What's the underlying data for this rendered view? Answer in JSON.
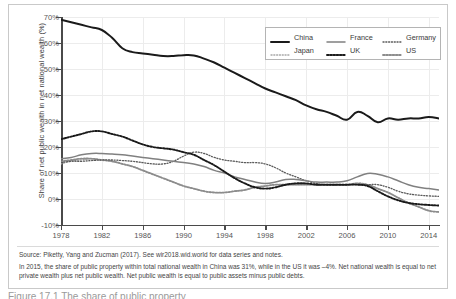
{
  "figure": {
    "ylabel": "Share of net public wealth in net national wealth (%)",
    "yticks": [
      "70%",
      "60%",
      "50%",
      "40%",
      "30%",
      "20%",
      "10%",
      "0%",
      "-10%"
    ],
    "xticks": [
      "1978",
      "1982",
      "1986",
      "1990",
      "1994",
      "1998",
      "2002",
      "2006",
      "2010",
      "2014"
    ],
    "legend": [
      {
        "label": "China",
        "style": "thick-solid-black"
      },
      {
        "label": "France",
        "style": "medium-solid-gray"
      },
      {
        "label": "Germany",
        "style": "fine-dotted-gray"
      },
      {
        "label": "Japan",
        "style": "fine-dotted-light"
      },
      {
        "label": "UK",
        "style": "bold-dotted-black"
      },
      {
        "label": "US",
        "style": "bold-dotted-gray"
      }
    ],
    "notes": {
      "source": "Source: Piketty, Yang and Zucman (2017). See wir2018.wid.world for data series and notes.",
      "detail": "In 2015, the share of public property within total national wealth in China was 31%, while in the US it was –4%. Net national wealth is equal to net private wealth plus net public wealth. Net public wealth is equal to public assets minus public debts."
    },
    "caption": "Figure 17.1 The share of public property"
  },
  "colors": {
    "china": "#1a1a1a",
    "france": "#808080",
    "germany": "#5a5a5a",
    "japan": "#a8a8a8",
    "uk": "#1a1a1a",
    "us": "#8c8c8c",
    "grid": "#ececec",
    "axis": "#4a4a4a"
  },
  "chart_data": {
    "type": "line",
    "title": "",
    "xlabel": "",
    "ylabel": "Share of net public wealth in net national wealth (%)",
    "xlim": [
      1978,
      2015
    ],
    "ylim": [
      -10,
      70
    ],
    "ytick_step": 10,
    "grid": true,
    "legend_position": "top-right",
    "x": [
      1978,
      1979,
      1980,
      1981,
      1982,
      1983,
      1984,
      1985,
      1986,
      1987,
      1988,
      1989,
      1990,
      1991,
      1992,
      1993,
      1994,
      1995,
      1996,
      1997,
      1998,
      1999,
      2000,
      2001,
      2002,
      2003,
      2004,
      2005,
      2006,
      2007,
      2008,
      2009,
      2010,
      2011,
      2012,
      2013,
      2014,
      2015
    ],
    "series": [
      {
        "name": "China",
        "values": [
          69,
          68,
          67,
          66,
          65,
          62,
          58,
          56.5,
          56,
          55.5,
          55,
          55,
          55.3,
          55.2,
          54,
          52.5,
          50.5,
          48.5,
          46.5,
          44.5,
          42.5,
          41,
          39.5,
          38,
          36,
          34.5,
          33.5,
          32,
          30.5,
          33.5,
          32,
          29.5,
          31,
          30.5,
          31,
          31,
          31.5,
          31
        ]
      },
      {
        "name": "France",
        "values": [
          15.5,
          16,
          17,
          17.5,
          17.5,
          17.3,
          17,
          16.5,
          16,
          15.5,
          15,
          14.5,
          14,
          13.5,
          12.5,
          11,
          10,
          8.5,
          7.5,
          6.5,
          6,
          6.5,
          7.5,
          7.5,
          7,
          6.5,
          6.5,
          6.5,
          7,
          8.5,
          9.8,
          9.5,
          8.5,
          7,
          5.5,
          4.5,
          4,
          3.5
        ]
      },
      {
        "name": "Germany",
        "values": [
          14,
          14.5,
          14.5,
          14.8,
          15,
          15,
          14.8,
          14.5,
          14,
          13.5,
          13.5,
          14.5,
          16.5,
          18,
          17.5,
          16,
          15,
          14.5,
          14,
          14,
          13.5,
          12,
          10,
          8.5,
          7,
          6,
          5.5,
          5.5,
          5.5,
          5.5,
          5.5,
          5.5,
          4.5,
          3,
          2,
          1.5,
          1.2,
          1
        ]
      },
      {
        "name": "Japan",
        "values": [
          13.5,
          14.5,
          15,
          15.5,
          15,
          14.5,
          13.5,
          12.5,
          11,
          9.5,
          8,
          6.5,
          5,
          4,
          3,
          2.5,
          2.5,
          3,
          3.5,
          4.5,
          5,
          5.5,
          5.5,
          5.5,
          5.5,
          5.5,
          5.5,
          5.5,
          5.5,
          6,
          5.5,
          4,
          2.5,
          0.5,
          -1.5,
          -3,
          -4.5,
          -5
        ]
      },
      {
        "name": "UK",
        "values": [
          23,
          24,
          25,
          26,
          26,
          25,
          24,
          22.5,
          21,
          20,
          19.5,
          19,
          18,
          17,
          15,
          13,
          10.5,
          8,
          6,
          4.5,
          4,
          4.5,
          5.5,
          6,
          6,
          5.5,
          5.5,
          5.5,
          5.5,
          5.5,
          5,
          3,
          1,
          -0.5,
          -1.5,
          -2,
          -2.3,
          -2.5
        ]
      },
      {
        "name": "US",
        "values": [
          14.5,
          15,
          15.5,
          15.5,
          15,
          14.5,
          13.5,
          12.5,
          11,
          9.5,
          8,
          6.5,
          5,
          4,
          3,
          2.5,
          2.5,
          3,
          3.5,
          4.5,
          5,
          5.5,
          5.5,
          5.5,
          5.5,
          5.5,
          5.5,
          5.5,
          5.5,
          6,
          5.5,
          4,
          2.5,
          0.5,
          -1.5,
          -3,
          -4.5,
          -5
        ]
      }
    ]
  }
}
